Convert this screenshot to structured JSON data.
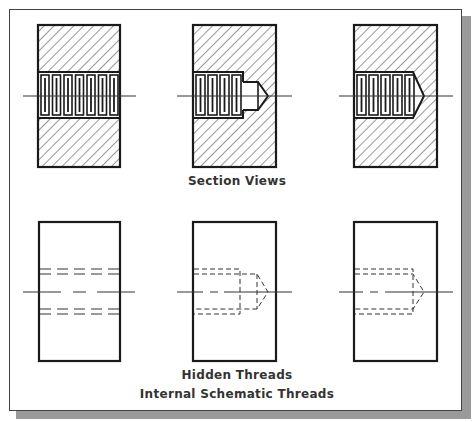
{
  "figure": {
    "captions": {
      "section_views": "Section Views",
      "hidden_threads": "Hidden Threads",
      "internal_schematic_threads": "Internal Schematic Threads"
    },
    "views": [
      {
        "row": "section",
        "type": "through-hole",
        "thread_count": 7
      },
      {
        "row": "section",
        "type": "blind-hole",
        "thread_count": 4
      },
      {
        "row": "section",
        "type": "blind-hole",
        "thread_count": 5
      },
      {
        "row": "hidden",
        "type": "through-hole"
      },
      {
        "row": "hidden",
        "type": "blind-hole"
      },
      {
        "row": "hidden",
        "type": "blind-hole"
      }
    ],
    "colors": {
      "line": "#1a1a1a",
      "hatch": "#333333",
      "shadow": "#9a9a9a",
      "text": "#333333"
    }
  }
}
